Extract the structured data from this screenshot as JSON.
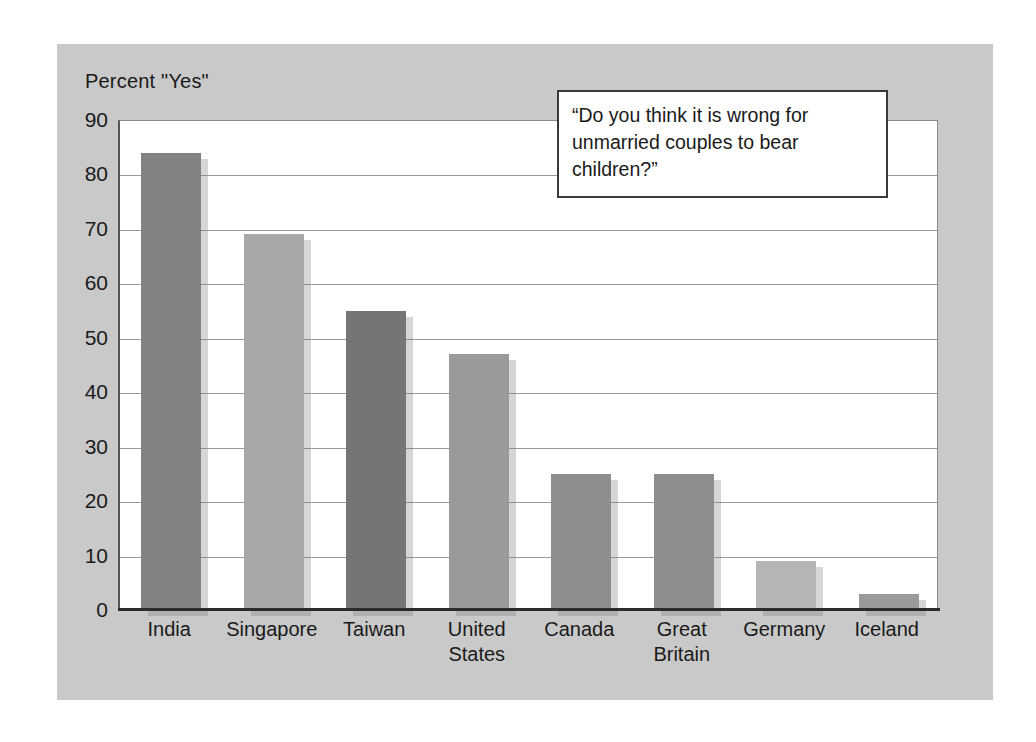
{
  "figure": {
    "panel_color": "#c9c9c9",
    "plot_background": "#ffffff"
  },
  "callout": {
    "text": "“Do you think it is wrong for\nunmarried couples to bear\nchildren?”"
  },
  "chart_data": {
    "type": "bar",
    "title": "",
    "subtitle": "",
    "ylabel": "Percent \"Yes\"",
    "xlabel": "",
    "ylim": [
      0,
      90
    ],
    "ytick_step": 10,
    "yticks": [
      0,
      10,
      20,
      30,
      40,
      50,
      60,
      70,
      80,
      90
    ],
    "ytick_labels": [
      "0",
      "10",
      "20",
      "30",
      "40",
      "50",
      "60",
      "70",
      "80",
      "90"
    ],
    "grid": "horizontal",
    "legend": "none",
    "categories": [
      "India",
      "Singapore",
      "Taiwan",
      "United States",
      "Canada",
      "Great Britain",
      "Germany",
      "Iceland"
    ],
    "category_label_lines": [
      [
        "India"
      ],
      [
        "Singapore"
      ],
      [
        "Taiwan"
      ],
      [
        "United",
        "States"
      ],
      [
        "Canada"
      ],
      [
        "Great",
        "Britain"
      ],
      [
        "Germany"
      ],
      [
        "Iceland"
      ]
    ],
    "values": [
      84,
      69,
      55,
      47,
      25,
      25,
      9,
      3
    ],
    "bar_colors": [
      "#828282",
      "#a8a8a8",
      "#757575",
      "#9a9a9a",
      "#8e8e8e",
      "#8e8e8e",
      "#b5b5b5",
      "#9a9a9a"
    ],
    "annotations": [
      "“Do you think it is wrong for unmarried couples to bear children?”"
    ]
  }
}
